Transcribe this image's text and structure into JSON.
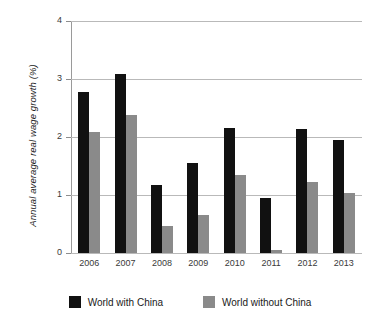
{
  "chart_data": {
    "type": "bar",
    "title": "",
    "xlabel": "",
    "ylabel": "Annual average real wage growth (%)",
    "categories": [
      "2006",
      "2007",
      "2008",
      "2009",
      "2010",
      "2011",
      "2012",
      "2013"
    ],
    "series": [
      {
        "name": "World with China",
        "color": "#111111",
        "values": [
          2.78,
          3.08,
          1.17,
          1.56,
          2.16,
          0.95,
          2.14,
          1.94
        ]
      },
      {
        "name": "World without China",
        "color": "#8a8a8a",
        "values": [
          2.09,
          2.38,
          0.46,
          0.66,
          1.35,
          0.05,
          1.22,
          1.03
        ]
      }
    ],
    "ylim": [
      0,
      4
    ],
    "yticks": [
      "0",
      "1",
      "2",
      "3",
      "4"
    ],
    "grid": true,
    "legend_position": "bottom"
  },
  "legend": {
    "items": [
      {
        "label": "World with China",
        "color": "#111111"
      },
      {
        "label": "World without China",
        "color": "#8a8a8a"
      }
    ]
  },
  "colors": {
    "series_with_china": "#111111",
    "series_without_china": "#8a8a8a",
    "gridline": "#b9b9b9",
    "axis": "#9a9a9a",
    "background": "#ffffff"
  }
}
